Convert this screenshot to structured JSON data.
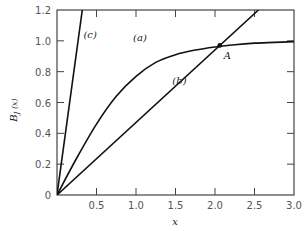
{
  "chart_data": {
    "type": "line",
    "title": "",
    "xlabel": "x",
    "ylabel": "B_J (x)",
    "xlim": [
      0,
      3.0
    ],
    "ylim": [
      0,
      1.2
    ],
    "grid": false,
    "x_ticks": [
      "0.5",
      "1.0",
      "1.5",
      "2.0",
      "2.5",
      "3.0"
    ],
    "y_ticks": [
      "0",
      "0.2",
      "0.4",
      "0.6",
      "0.8",
      "1.0",
      "1.2"
    ],
    "series": [
      {
        "name": "(a)",
        "kind": "curve",
        "description": "Brillouin-like saturating curve",
        "x": [
          0,
          0.25,
          0.5,
          0.75,
          1.0,
          1.25,
          1.5,
          1.75,
          2.0,
          2.25,
          2.5,
          2.75,
          3.0
        ],
        "y": [
          0,
          0.24,
          0.46,
          0.64,
          0.77,
          0.86,
          0.91,
          0.94,
          0.96,
          0.975,
          0.985,
          0.99,
          0.995
        ]
      },
      {
        "name": "(b)",
        "kind": "line",
        "slope": 0.47,
        "x": [
          0,
          2.55
        ],
        "y": [
          0,
          1.2
        ]
      },
      {
        "name": "(c)",
        "kind": "line",
        "slope": 3.75,
        "x": [
          0,
          0.32
        ],
        "y": [
          0,
          1.2
        ]
      }
    ],
    "annotations": [
      {
        "label": "A",
        "x": 2.06,
        "y": 0.97,
        "marker": "dot"
      },
      {
        "label": "(a)",
        "x": 1.05,
        "y": 1.0
      },
      {
        "label": "(b)",
        "x": 1.55,
        "y": 0.72
      },
      {
        "label": "(c)",
        "x": 0.42,
        "y": 1.02
      }
    ]
  }
}
